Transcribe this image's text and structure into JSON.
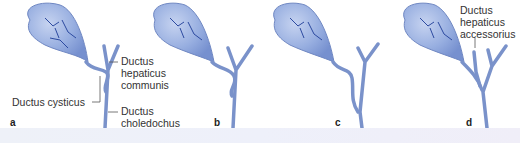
{
  "figure": {
    "panels": [
      {
        "letter": "a",
        "variant": "cystic duct spirals anteriorly around common hepatic duct"
      },
      {
        "letter": "b",
        "variant": "cystic duct spirals posteriorly around common hepatic duct"
      },
      {
        "letter": "c",
        "variant": "long cystic duct running parallel, low junction"
      },
      {
        "letter": "d",
        "variant": "accessory hepatic duct"
      }
    ],
    "labels": {
      "cystic_duct": "Ductus cysticus",
      "common_hepatic_duct_line1": "Ductus",
      "common_hepatic_duct_line2": "hepaticus",
      "common_hepatic_duct_line3": "communis",
      "common_bile_duct_line1": "Ductus",
      "common_bile_duct_line2": "choledochus",
      "accessory_duct_line1": "Ductus",
      "accessory_duct_line2": "hepaticus",
      "accessory_duct_line3": "accessorius"
    },
    "colors": {
      "organ_fill": "#8fa8dc",
      "organ_light": "#b9c9ec",
      "duct_stroke": "#6f87c2",
      "vessel": "#2c4aa0",
      "leader_line": "#555555"
    }
  }
}
